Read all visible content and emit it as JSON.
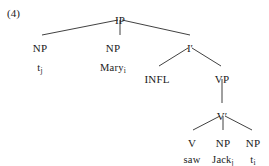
{
  "example": {
    "number_label": "(4)"
  },
  "diagram": {
    "type": "syntax-tree",
    "sentence": "Mary saw Jack",
    "line_color": "#2b2b2b",
    "text_color": "#1a1a1a",
    "background": "#ffffff",
    "nodes": [
      {
        "id": "ip",
        "label": "IP",
        "x": 120,
        "y": 14,
        "kind": "category"
      },
      {
        "id": "np1",
        "label": "NP",
        "x": 40,
        "y": 42,
        "kind": "category"
      },
      {
        "id": "t_j",
        "label": "t",
        "sub": "j",
        "x": 40,
        "y": 62,
        "kind": "lexical"
      },
      {
        "id": "np2",
        "label": "NP",
        "x": 113,
        "y": 42,
        "kind": "category"
      },
      {
        "id": "mary",
        "label": "Mary",
        "sub": "i",
        "x": 113,
        "y": 62,
        "kind": "lexical"
      },
      {
        "id": "ibar",
        "label": "I′",
        "x": 190,
        "y": 42,
        "kind": "category"
      },
      {
        "id": "infl",
        "label": "INFL",
        "x": 157,
        "y": 73,
        "kind": "category"
      },
      {
        "id": "vp",
        "label": "VP",
        "x": 222,
        "y": 73,
        "kind": "category"
      },
      {
        "id": "vbar",
        "label": "V′",
        "x": 222,
        "y": 110,
        "kind": "category"
      },
      {
        "id": "v",
        "label": "V",
        "x": 192,
        "y": 137,
        "kind": "category"
      },
      {
        "id": "saw",
        "label": "saw",
        "x": 192,
        "y": 154,
        "kind": "lexical"
      },
      {
        "id": "np3",
        "label": "NP",
        "x": 223,
        "y": 137,
        "kind": "category"
      },
      {
        "id": "jack",
        "label": "Jack",
        "sub": "j",
        "x": 223,
        "y": 154,
        "kind": "lexical"
      },
      {
        "id": "np4",
        "label": "NP",
        "x": 253,
        "y": 137,
        "kind": "category"
      },
      {
        "id": "t_i",
        "label": "t",
        "sub": "i",
        "x": 253,
        "y": 154,
        "kind": "lexical"
      }
    ],
    "edges": [
      {
        "from": "ip",
        "to": "np1",
        "x1": 118,
        "y1": 20,
        "x2": 42,
        "y2": 35
      },
      {
        "from": "ip",
        "to": "np2",
        "x1": 120,
        "y1": 20,
        "x2": 120,
        "y2": 35
      },
      {
        "from": "ip",
        "to": "ibar",
        "x1": 122,
        "y1": 20,
        "x2": 190,
        "y2": 35
      },
      {
        "from": "ibar",
        "to": "infl",
        "x1": 188,
        "y1": 48,
        "x2": 159,
        "y2": 66
      },
      {
        "from": "ibar",
        "to": "vp",
        "x1": 192,
        "y1": 48,
        "x2": 221,
        "y2": 66
      },
      {
        "from": "vp",
        "to": "vbar",
        "x1": 222,
        "y1": 79,
        "x2": 222,
        "y2": 103
      },
      {
        "from": "vbar",
        "to": "v",
        "x1": 220,
        "y1": 116,
        "x2": 193,
        "y2": 130
      },
      {
        "from": "vbar",
        "to": "np3",
        "x1": 223,
        "y1": 116,
        "x2": 223,
        "y2": 130
      },
      {
        "from": "vbar",
        "to": "np4",
        "x1": 225,
        "y1": 116,
        "x2": 252,
        "y2": 130
      }
    ]
  }
}
